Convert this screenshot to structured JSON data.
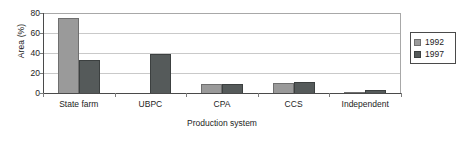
{
  "chart_data": {
    "type": "bar",
    "title": "",
    "xlabel": "Production system",
    "ylabel": "Area (%)",
    "categories": [
      "State farm",
      "UBPC",
      "CPA",
      "CCS",
      "Independent"
    ],
    "series": [
      {
        "name": "1992",
        "color": "#9a9a9a",
        "values": [
          75,
          0,
          10,
          11,
          1.5
        ]
      },
      {
        "name": "1997",
        "color": "#555a5a",
        "values": [
          34,
          40,
          10,
          12,
          4
        ]
      }
    ],
    "yticks": [
      "0",
      "20",
      "40",
      "60",
      "80"
    ],
    "ylim": [
      0,
      80
    ],
    "grid": true,
    "legend_position": "right"
  },
  "legend": {
    "items": [
      {
        "label": "1992"
      },
      {
        "label": "1997"
      }
    ]
  }
}
